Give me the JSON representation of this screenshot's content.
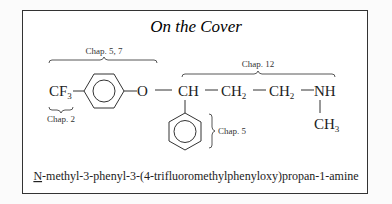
{
  "title": "On the Cover",
  "annotations": {
    "chap_5_7": "Chap. 5, 7",
    "chap_12": "Chap. 12",
    "chap_2": "Chap. 2",
    "chap_5": "Chap. 5"
  },
  "structure": {
    "cf3": "CF",
    "cf3_sub": "3",
    "oxygen": "O",
    "ch": "CH",
    "ch2_a": "CH",
    "ch2_a_sub": "2",
    "ch2_b": "CH",
    "ch2_b_sub": "2",
    "nh": "NH",
    "ch3": "CH",
    "ch3_sub": "3"
  },
  "compound_name": {
    "prefix": "N",
    "rest": "-methyl-3-phenyl-3-(4-trifluoromethylphenyloxy)propan-1-amine"
  }
}
